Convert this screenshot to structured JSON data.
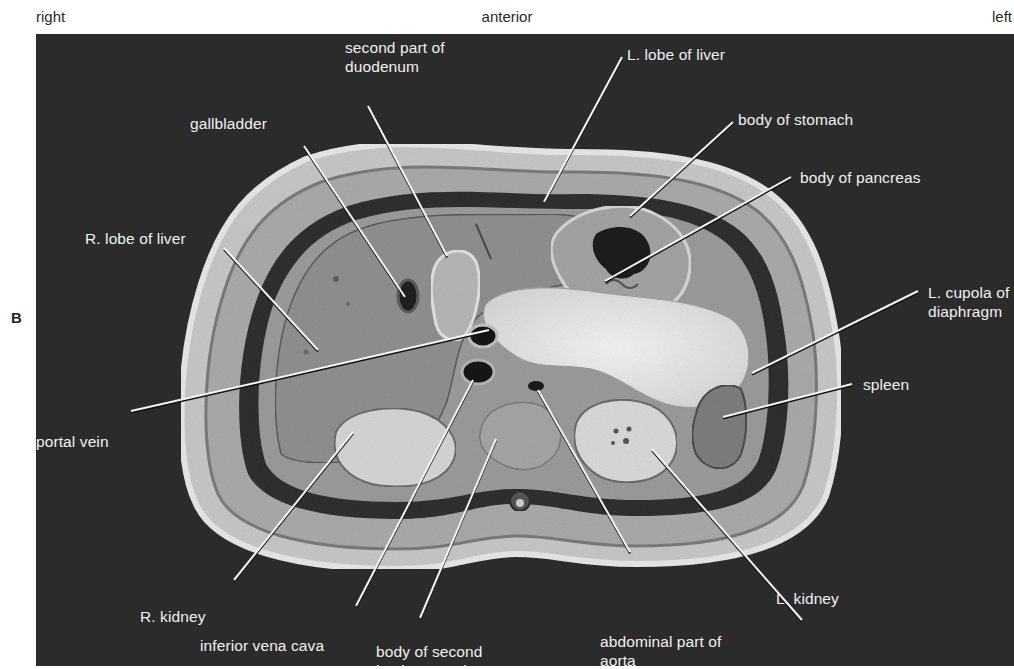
{
  "orientation": {
    "right": "right",
    "anterior": "anterior",
    "left": "left"
  },
  "panel_letter": "B",
  "colors": {
    "page_background": "#ffffff",
    "panel_background": "#2b2b2b",
    "label_text": "#f0f0f0",
    "leader_line": "#f5f5f5",
    "leader_shadow": "#111111"
  },
  "figure": {
    "type": "transverse section of abdomen (axial)",
    "labels": [
      {
        "id": "second-part-of-duodenum",
        "text": "second part of\nduodenum",
        "x": 309,
        "y": 4,
        "line": [
          [
            332,
            72
          ],
          [
            411,
            222
          ]
        ]
      },
      {
        "id": "l-lobe-of-liver",
        "text": "L. lobe of liver",
        "x": 591,
        "y": 11,
        "line": [
          [
            586,
            23
          ],
          [
            508,
            168
          ]
        ]
      },
      {
        "id": "gallbladder",
        "text": "gallbladder",
        "x": 154,
        "y": 80,
        "line": [
          [
            268,
            112
          ],
          [
            369,
            263
          ]
        ]
      },
      {
        "id": "body-of-stomach",
        "text": "body of stomach",
        "x": 702,
        "y": 76,
        "line": [
          [
            697,
            88
          ],
          [
            594,
            182
          ]
        ]
      },
      {
        "id": "body-of-pancreas",
        "text": "body of pancreas",
        "x": 764,
        "y": 134,
        "line": [
          [
            755,
            143
          ],
          [
            569,
            247
          ]
        ]
      },
      {
        "id": "r-lobe-of-liver",
        "text": "R. lobe of liver",
        "x": 49,
        "y": 195,
        "line": [
          [
            188,
            214
          ],
          [
            282,
            316
          ]
        ]
      },
      {
        "id": "l-cupola-of-diaphragm",
        "text": "L. cupola of\ndiaphragm",
        "x": 892,
        "y": 249,
        "line": [
          [
            882,
            257
          ],
          [
            716,
            339
          ]
        ]
      },
      {
        "id": "portal-vein",
        "text": "portal vein",
        "x": 0,
        "y": 398,
        "line": [
          [
            95,
            377
          ],
          [
            453,
            296
          ]
        ]
      },
      {
        "id": "spleen",
        "text": "spleen",
        "x": 827,
        "y": 341,
        "line": [
          [
            816,
            350
          ],
          [
            687,
            383
          ]
        ]
      },
      {
        "id": "r-kidney",
        "text": "R. kidney",
        "x": 104,
        "y": 573,
        "line": [
          [
            198,
            546
          ],
          [
            317,
            398
          ]
        ]
      },
      {
        "id": "inferior-vena-cava",
        "text": "inferior vena cava",
        "x": 164,
        "y": 602,
        "line": [
          [
            320,
            572
          ],
          [
            437,
            346
          ]
        ]
      },
      {
        "id": "body-of-second-lumbar-vertebra",
        "text": "body of second\nlumbar vertebra",
        "x": 340,
        "y": 608,
        "line": [
          [
            384,
            584
          ],
          [
            460,
            405
          ]
        ]
      },
      {
        "id": "abdominal-part-of-aorta",
        "text": "abdominal part of\naorta",
        "x": 564,
        "y": 598,
        "line": [
          [
            594,
            518
          ],
          [
            502,
            356
          ]
        ]
      },
      {
        "id": "l-kidney",
        "text": "L. kidney",
        "x": 740,
        "y": 555,
        "line": [
          [
            766,
            586
          ],
          [
            616,
            415
          ]
        ]
      }
    ]
  }
}
